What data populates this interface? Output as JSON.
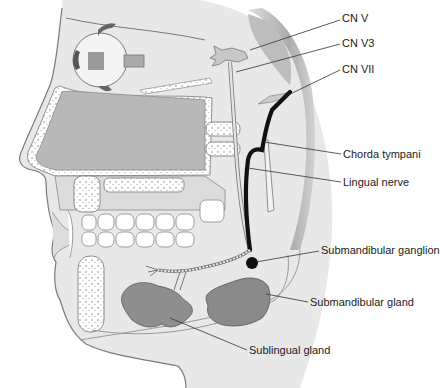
{
  "figure": {
    "colors": {
      "skin": "#e6e6e6",
      "outline": "#7a7a7a",
      "sinus": "#b9b9b9",
      "gland": "#8f8f8f",
      "nerve_black": "#111111",
      "leader": "#333333",
      "ear_shade": "#a8a8a8"
    }
  },
  "labels": [
    {
      "id": "cn-v",
      "text": "CN V",
      "x": 342,
      "y": 12
    },
    {
      "id": "cn-v3",
      "text": "CN V3",
      "x": 342,
      "y": 37
    },
    {
      "id": "cn-vii",
      "text": "CN VII",
      "x": 342,
      "y": 63
    },
    {
      "id": "chorda-tympani",
      "text": "Chorda tympani",
      "x": 343,
      "y": 148
    },
    {
      "id": "lingual-nerve",
      "text": "Lingual nerve",
      "x": 343,
      "y": 176
    },
    {
      "id": "submandibular-ganglion",
      "text": "Submandibular ganglion",
      "x": 321,
      "y": 244
    },
    {
      "id": "submandibular-gland",
      "text": "Submandibular gland",
      "x": 310,
      "y": 296
    },
    {
      "id": "sublingual-gland",
      "text": "Sublingual gland",
      "x": 249,
      "y": 344
    }
  ]
}
